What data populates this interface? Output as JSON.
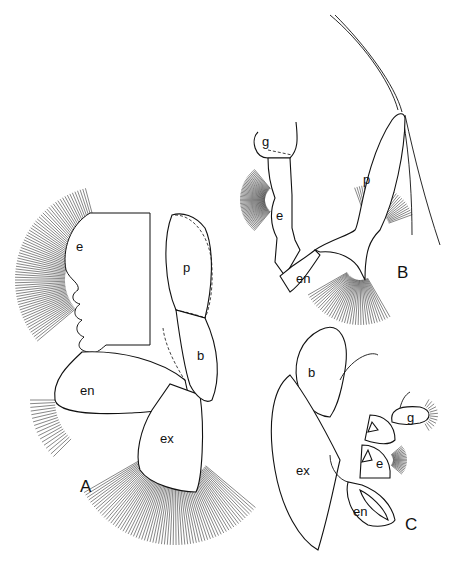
{
  "figure": {
    "panels": [
      {
        "id": "A",
        "label": "A",
        "parts": {
          "e": "e",
          "p": "p",
          "b": "b",
          "en": "en",
          "ex": "ex"
        }
      },
      {
        "id": "B",
        "label": "B",
        "parts": {
          "g": "g",
          "e": "e",
          "p": "p",
          "en": "en"
        }
      },
      {
        "id": "C",
        "label": "C",
        "parts": {
          "b": "b",
          "g": "g",
          "e": "e",
          "ex": "ex",
          "en": "en"
        }
      }
    ]
  }
}
